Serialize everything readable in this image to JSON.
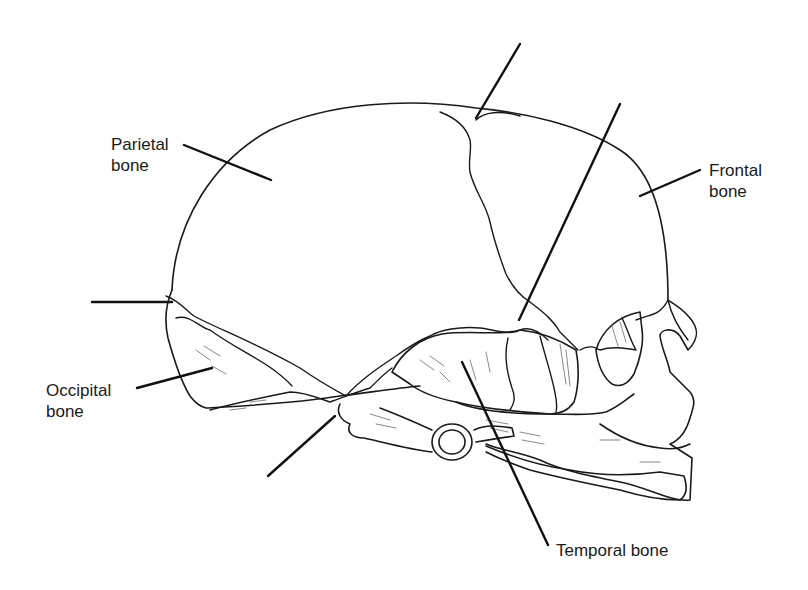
{
  "diagram": {
    "labels": {
      "parietal": "Parietal\nbone",
      "frontal": "Frontal\nbone",
      "occipital": "Occipital\nbone",
      "temporal": "Temporal bone"
    },
    "unlabeled_leaders": [
      {
        "id": "top-fontanelle",
        "from": [
          520,
          44
        ],
        "to": [
          476,
          118
        ]
      },
      {
        "id": "anterolateral-fontanelle",
        "from": [
          620,
          104
        ],
        "to": [
          519,
          320
        ]
      },
      {
        "id": "posterolateral-fontanelle",
        "from": [
          92,
          302
        ],
        "to": [
          172,
          302
        ]
      },
      {
        "id": "mastoid-fontanelle",
        "from": [
          268,
          476
        ],
        "to": [
          335,
          416
        ]
      }
    ],
    "colors": {
      "line": "#1a1a1a",
      "background": "#ffffff"
    }
  }
}
